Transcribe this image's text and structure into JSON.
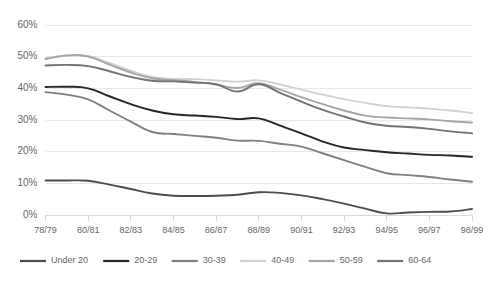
{
  "chart_data": {
    "type": "line",
    "title": "",
    "subtitle": "",
    "xlabel": "",
    "ylabel": "",
    "ylim": [
      0,
      60
    ],
    "ytick_values": [
      0,
      10,
      20,
      30,
      40,
      50,
      60
    ],
    "ytick_labels": [
      "0%",
      "10%",
      "20%",
      "30%",
      "40%",
      "50%",
      "60%"
    ],
    "grid": true,
    "legend_position": "bottom",
    "x": [
      "78/79",
      "79/80",
      "80/81",
      "81/82",
      "82/83",
      "83/84",
      "84/85",
      "85/86",
      "86/87",
      "87/88",
      "88/89",
      "89/90",
      "90/91",
      "91/92",
      "92/93",
      "93/94",
      "94/95",
      "95/96",
      "96/97",
      "97/98",
      "98/99"
    ],
    "xtick_labels": [
      "78/79",
      "80/81",
      "82/83",
      "84/85",
      "86/87",
      "88/89",
      "90/91",
      "92/93",
      "94/95",
      "96/97",
      "98/99"
    ],
    "xtick_indices": [
      0,
      2,
      4,
      6,
      8,
      10,
      12,
      14,
      16,
      18,
      20
    ],
    "series": [
      {
        "name": "Under 20",
        "color": "#4d4d4d",
        "values": [
          10.9,
          10.9,
          10.8,
          9.6,
          8.2,
          6.8,
          6.1,
          6.0,
          6.1,
          6.4,
          7.2,
          7.0,
          6.2,
          5.0,
          3.6,
          2.0,
          0.5,
          0.8,
          1.0,
          1.1,
          1.9
        ]
      },
      {
        "name": "20-29",
        "color": "#262626",
        "values": [
          40.4,
          40.5,
          40.0,
          37.5,
          35.0,
          33.0,
          31.8,
          31.4,
          31.0,
          30.3,
          30.5,
          28.2,
          25.8,
          23.2,
          21.3,
          20.5,
          19.8,
          19.4,
          19.0,
          18.8,
          18.4
        ]
      },
      {
        "name": "30-39",
        "color": "#808080",
        "values": [
          38.8,
          38.0,
          36.5,
          33.0,
          29.5,
          26.2,
          25.6,
          25.0,
          24.4,
          23.5,
          23.4,
          22.5,
          21.6,
          19.5,
          17.3,
          15.2,
          13.2,
          12.6,
          12.0,
          11.2,
          10.5
        ]
      },
      {
        "name": "40-49",
        "color": "#d2d2d2",
        "values": [
          49.6,
          50.3,
          50.2,
          48.0,
          45.6,
          43.6,
          43.0,
          42.9,
          42.5,
          42.1,
          42.5,
          41.2,
          39.6,
          38.0,
          36.6,
          35.4,
          34.4,
          34.0,
          33.6,
          33.0,
          32.2
        ]
      },
      {
        "name": "50-59",
        "color": "#a6a6a6",
        "values": [
          49.2,
          50.4,
          50.0,
          47.5,
          45.0,
          43.2,
          42.6,
          42.0,
          41.2,
          40.1,
          41.6,
          39.6,
          37.2,
          35.0,
          33.0,
          31.4,
          30.8,
          30.5,
          30.2,
          29.6,
          29.2
        ]
      },
      {
        "name": "60-64",
        "color": "#737373",
        "values": [
          47.2,
          47.4,
          47.0,
          45.4,
          43.6,
          42.4,
          42.2,
          41.8,
          41.3,
          39.0,
          41.3,
          38.6,
          35.8,
          33.2,
          31.1,
          29.2,
          28.2,
          27.8,
          27.2,
          26.4,
          25.8
        ]
      }
    ]
  },
  "legend": {
    "items": [
      {
        "label": "Under 20"
      },
      {
        "label": "20-29"
      },
      {
        "label": "30-39"
      },
      {
        "label": "40-49"
      },
      {
        "label": "50-59"
      },
      {
        "label": "60-64"
      }
    ]
  }
}
